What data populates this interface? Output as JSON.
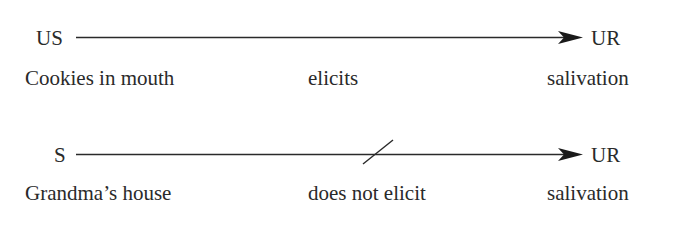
{
  "diagram": {
    "rows": [
      {
        "stimulus": "US",
        "stimulus_label": "Cookies in mouth",
        "relation": "elicits",
        "relation_blocked": false,
        "response": "UR",
        "response_label": "salivation"
      },
      {
        "stimulus": "S",
        "stimulus_label": "Grandma’s house",
        "relation": "does not elicit",
        "relation_blocked": true,
        "response": "UR",
        "response_label": "salivation"
      }
    ],
    "colors": {
      "ink": "#2a2a2a",
      "background": "#ffffff"
    }
  }
}
